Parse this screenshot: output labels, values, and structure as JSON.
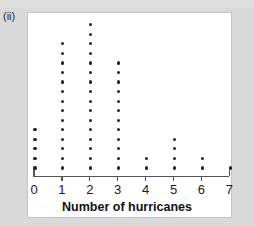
{
  "figure": {
    "label": "(ii)"
  },
  "chart_data": {
    "type": "bar",
    "plot_style": "dotplot",
    "title": "",
    "xlabel": "Number of hurricanes",
    "ylabel": "",
    "categories": [
      "0",
      "1",
      "2",
      "3",
      "4",
      "5",
      "6",
      "7"
    ],
    "values": [
      5,
      14,
      16,
      12,
      2,
      4,
      2,
      1
    ],
    "xlim": [
      0,
      7
    ],
    "ylim": [
      0,
      16
    ],
    "grid": false,
    "legend": null,
    "dot_color": "#262626",
    "axis_color": "#555555",
    "panel_background": "#ffffff",
    "page_background": "#d9d9d9",
    "annotations": []
  },
  "axis": {
    "tick_labels": [
      "0",
      "1",
      "2",
      "3",
      "4",
      "5",
      "6",
      "7"
    ],
    "title": "Number of hurricanes"
  }
}
